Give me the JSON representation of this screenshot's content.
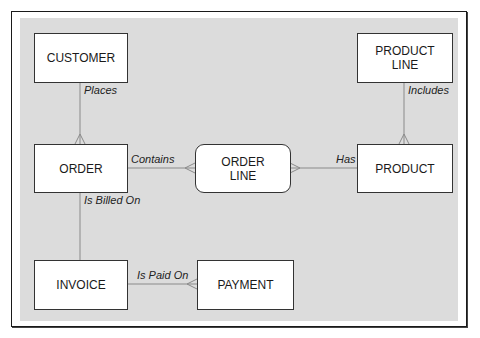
{
  "diagram": {
    "type": "entity-relationship",
    "entities": [
      {
        "id": "customer",
        "label": "CUSTOMER"
      },
      {
        "id": "product_line",
        "label": "PRODUCT\nLINE"
      },
      {
        "id": "order",
        "label": "ORDER"
      },
      {
        "id": "order_line",
        "label": "ORDER\nLINE"
      },
      {
        "id": "product",
        "label": "PRODUCT"
      },
      {
        "id": "invoice",
        "label": "INVOICE"
      },
      {
        "id": "payment",
        "label": "PAYMENT"
      }
    ],
    "relationships": [
      {
        "from": "customer",
        "to": "order",
        "label": "Places",
        "many_end": "order"
      },
      {
        "from": "product_line",
        "to": "product",
        "label": "Includes",
        "many_end": "product"
      },
      {
        "from": "order",
        "to": "order_line",
        "label": "Contains",
        "many_end": "order_line"
      },
      {
        "from": "product",
        "to": "order_line",
        "label": "Has",
        "many_end": "order_line"
      },
      {
        "from": "order",
        "to": "invoice",
        "label": "Is Billed On",
        "many_end": null
      },
      {
        "from": "invoice",
        "to": "payment",
        "label": "Is Paid On",
        "many_end": "payment"
      }
    ]
  },
  "colors": {
    "panel": "#dcdcdc",
    "line": "#8a8a8a",
    "border": "#333333"
  }
}
